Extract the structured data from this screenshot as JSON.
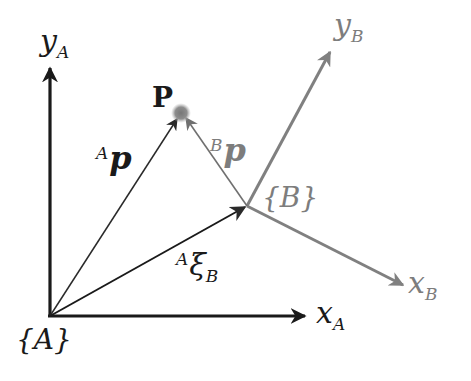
{
  "diagram": {
    "colors": {
      "frame_a": "#1a1a1a",
      "frame_b": "#808080",
      "vector_a_p": "#2a2a2a",
      "vector_b_p": "#707070",
      "point_p": "#8a8a8a"
    },
    "frame_a": {
      "origin_label": "{A}",
      "x_axis": {
        "base": "x",
        "sub": "A"
      },
      "y_axis": {
        "base": "y",
        "sub": "A"
      }
    },
    "frame_b": {
      "origin_label": "{B}",
      "x_axis": {
        "base": "x",
        "sub": "B"
      },
      "y_axis": {
        "base": "y",
        "sub": "B"
      }
    },
    "point": {
      "label": "P"
    },
    "vectors": {
      "a_p": {
        "sup": "A",
        "base": "p"
      },
      "b_p": {
        "sup": "B",
        "base": "p"
      },
      "a_xi_b": {
        "sup": "A",
        "base": "ξ",
        "sub": "B"
      }
    }
  }
}
